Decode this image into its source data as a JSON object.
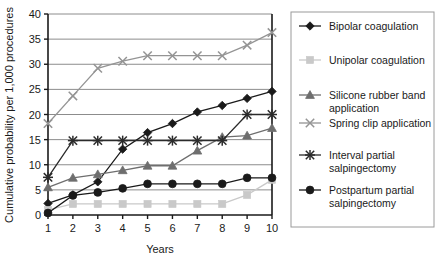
{
  "chart_data": {
    "type": "line",
    "title": "",
    "xlabel": "Years",
    "ylabel": "Cumulative probability per 1,000 procedures",
    "x": [
      1,
      2,
      3,
      4,
      5,
      6,
      7,
      8,
      9,
      10
    ],
    "xticklabels": [
      "1",
      "2",
      "3",
      "4",
      "5",
      "6",
      "7",
      "8",
      "9",
      "10"
    ],
    "yticklabels": [
      "0",
      "5",
      "10",
      "15",
      "20",
      "25",
      "30",
      "35",
      "40"
    ],
    "yticks": [
      0,
      5,
      10,
      15,
      20,
      25,
      30,
      35,
      40
    ],
    "ylim": [
      0,
      40
    ],
    "xlim": [
      1,
      10
    ],
    "grid": "horizontal",
    "legend_position": "right",
    "series": [
      {
        "name": "Bipolar coagulation",
        "marker": "diamond",
        "color": "#1a1a1a",
        "values": [
          2.3,
          4.0,
          6.6,
          13.1,
          16.4,
          18.2,
          20.5,
          21.8,
          23.2,
          24.6
        ]
      },
      {
        "name": "Unipolar coagulation",
        "marker": "square",
        "color": "#c9c9c9",
        "values": [
          1.0,
          2.2,
          2.2,
          2.2,
          2.2,
          2.2,
          2.2,
          2.2,
          4.0,
          7.0
        ]
      },
      {
        "name": "Silicone rubber band application",
        "marker": "triangle",
        "color": "#6e6e6e",
        "values": [
          5.5,
          7.4,
          8.1,
          8.9,
          9.8,
          9.8,
          12.8,
          15.5,
          15.8,
          17.3
        ]
      },
      {
        "name": "Spring clip application",
        "marker": "x",
        "color": "#949494",
        "values": [
          18.2,
          23.7,
          29.2,
          30.6,
          31.7,
          31.7,
          31.7,
          31.7,
          33.8,
          36.3
        ]
      },
      {
        "name": "Interval partial salpingectomy",
        "marker": "asterisk",
        "color": "#2b2b2b",
        "values": [
          7.5,
          14.8,
          14.8,
          14.8,
          14.8,
          14.8,
          14.8,
          14.8,
          20.0,
          20.0
        ]
      },
      {
        "name": "Postpartum partial salpingectomy",
        "marker": "circle",
        "color": "#1a1a1a",
        "values": [
          0.4,
          3.9,
          4.5,
          5.3,
          6.2,
          6.2,
          6.2,
          6.2,
          7.4,
          7.4
        ]
      }
    ]
  },
  "legend": {
    "entries": [
      {
        "label_line1": "Bipolar coagulation",
        "label_line2": ""
      },
      {
        "label_line1": "Unipolar coagulation",
        "label_line2": ""
      },
      {
        "label_line1": "Silicone rubber band",
        "label_line2": "application"
      },
      {
        "label_line1": "Spring clip application",
        "label_line2": ""
      },
      {
        "label_line1": "Interval partial",
        "label_line2": "salpingectomy"
      },
      {
        "label_line1": "Postpartum partial",
        "label_line2": "salpingectomy"
      }
    ]
  },
  "colors": {
    "axis": "#1a1a1a",
    "grid": "#8c8c8c",
    "legend_border": "#9a9a9a",
    "background": "#ffffff"
  }
}
